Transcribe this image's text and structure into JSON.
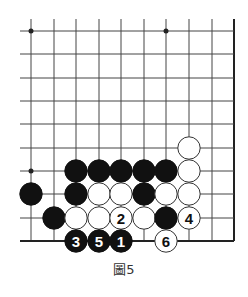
{
  "diagram": {
    "caption": "圖5",
    "colors": {
      "line": "#444444",
      "edge": "#222222",
      "black": "#111111",
      "white": "#ffffff"
    },
    "grid": {
      "columns_x": [
        31,
        54,
        76,
        99,
        121,
        144,
        166,
        189,
        212,
        234
      ],
      "rows_y": [
        31,
        54,
        78,
        101,
        124,
        148,
        171,
        194,
        218,
        241
      ],
      "left_extent": 20,
      "top_extent": 19,
      "right_edge_col": 9,
      "bottom_edge_row": 9
    },
    "star_points": [
      {
        "col": 0,
        "row": 0
      },
      {
        "col": 6,
        "row": 0
      },
      {
        "col": 0,
        "row": 6
      }
    ],
    "stones": [
      {
        "color": "white",
        "col": 7,
        "row": 5,
        "label": ""
      },
      {
        "color": "black",
        "col": 2,
        "row": 6,
        "label": ""
      },
      {
        "color": "black",
        "col": 3,
        "row": 6,
        "label": ""
      },
      {
        "color": "black",
        "col": 4,
        "row": 6,
        "label": ""
      },
      {
        "color": "black",
        "col": 5,
        "row": 6,
        "label": ""
      },
      {
        "color": "black",
        "col": 6,
        "row": 6,
        "label": ""
      },
      {
        "color": "white",
        "col": 7,
        "row": 6,
        "label": ""
      },
      {
        "color": "black",
        "col": 0,
        "row": 7,
        "label": ""
      },
      {
        "color": "black",
        "col": 2,
        "row": 7,
        "label": ""
      },
      {
        "color": "white",
        "col": 3,
        "row": 7,
        "label": ""
      },
      {
        "color": "white",
        "col": 4,
        "row": 7,
        "label": ""
      },
      {
        "color": "black",
        "col": 5,
        "row": 7,
        "label": ""
      },
      {
        "color": "white",
        "col": 6,
        "row": 7,
        "label": ""
      },
      {
        "color": "white",
        "col": 7,
        "row": 7,
        "label": ""
      },
      {
        "color": "black",
        "col": 1,
        "row": 8,
        "label": ""
      },
      {
        "color": "white",
        "col": 2,
        "row": 8,
        "label": ""
      },
      {
        "color": "white",
        "col": 3,
        "row": 8,
        "label": ""
      },
      {
        "color": "white",
        "col": 4,
        "row": 8,
        "label": "2"
      },
      {
        "color": "white",
        "col": 5,
        "row": 8,
        "label": ""
      },
      {
        "color": "black",
        "col": 6,
        "row": 8,
        "label": ""
      },
      {
        "color": "white",
        "col": 7,
        "row": 8,
        "label": "4"
      },
      {
        "color": "black",
        "col": 2,
        "row": 9,
        "label": "3"
      },
      {
        "color": "black",
        "col": 3,
        "row": 9,
        "label": "5"
      },
      {
        "color": "black",
        "col": 4,
        "row": 9,
        "label": "1"
      },
      {
        "color": "white",
        "col": 6,
        "row": 9,
        "label": "6"
      }
    ]
  }
}
